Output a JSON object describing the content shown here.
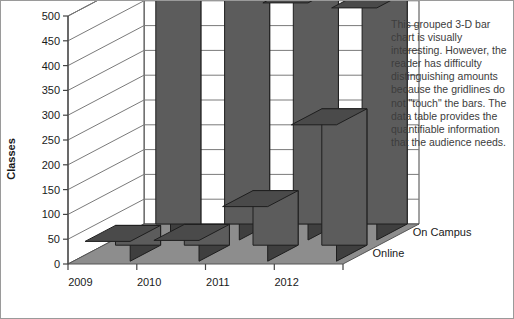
{
  "figure": {
    "background": "#ffffff",
    "border_color": "#9a9a9a"
  },
  "caption": {
    "text": "This grouped 3-D bar chart is visually interesting. However, the reader has difficulty distinguishing amounts because the gridlines do not \"touch\" the bars. The data table provides the quantifiable information that the audience needs.",
    "color": "#3c3c3c"
  },
  "chart_data": {
    "type": "bar",
    "title": "",
    "xlabel": "",
    "ylabel": "Classes",
    "ylim": [
      0,
      500
    ],
    "yticks": [
      0,
      50,
      100,
      150,
      200,
      250,
      300,
      350,
      400,
      450,
      500
    ],
    "ytick_labels": [
      "0",
      "50",
      "100",
      "150",
      "200",
      "250",
      "300",
      "350",
      "400",
      "450",
      "500"
    ],
    "grid": true,
    "legend": "depth-axis",
    "projection": "3d",
    "categories": [
      "2009",
      "2010",
      "2011",
      "2012"
    ],
    "series": [
      {
        "name": "On Campus",
        "values": [
          520,
          490,
          478,
          468
        ],
        "color": "#5c5c5c"
      },
      {
        "name": "Online",
        "values": [
          40,
          42,
          110,
          275
        ],
        "color": "#5c5c5c"
      }
    ],
    "colors": {
      "bar_front": "#5c5c5c",
      "bar_side": "#3f3f3f",
      "bar_top": "#4a4a4a",
      "bar_edge": "#1e1e1e",
      "floor": "#8d8d8d",
      "floor_edge": "#555555",
      "wall": "#ffffff",
      "gridline": "#7a7a7a",
      "axis": "#444444"
    }
  }
}
